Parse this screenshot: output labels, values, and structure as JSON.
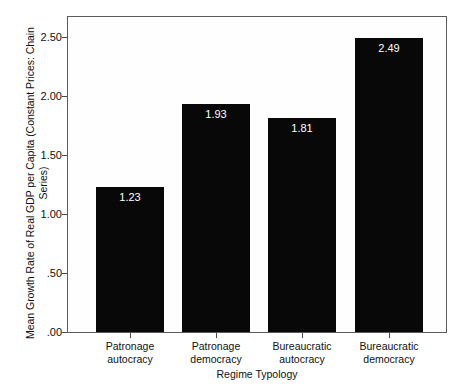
{
  "chart_data": {
    "type": "bar",
    "title": "",
    "xlabel": "Regime Typology",
    "ylabel": "Mean Growth Rate of Real GDP per Capita (Constant Prices: Chain Series)",
    "categories": [
      "Patronage\nautocracy",
      "Patronage\ndemocracy",
      "Bureaucratic\nautocracy",
      "Bureaucratic\ndemocracy"
    ],
    "values": [
      1.23,
      1.93,
      1.81,
      2.49
    ],
    "value_labels": [
      "1.23",
      "1.93",
      "1.81",
      "2.49"
    ],
    "ylim": [
      0.0,
      2.685
    ],
    "yticks": [
      0.0,
      0.5,
      1.0,
      1.5,
      2.0,
      2.5
    ],
    "ytick_labels": [
      ".00",
      ".50",
      "1.00",
      "1.50",
      "2.00",
      "2.50"
    ],
    "grid": false,
    "legend": null,
    "bar_color": "#080808",
    "value_label_color": "#ffffff",
    "frame_color": "#5b5b5b",
    "plot_background": "#fefefe"
  }
}
